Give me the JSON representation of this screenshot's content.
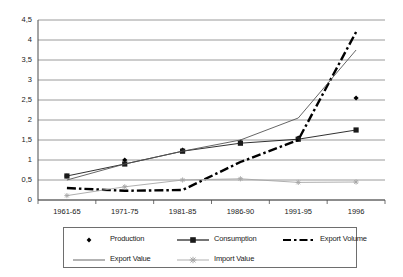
{
  "chart_data": {
    "type": "line",
    "title": "",
    "xlabel": "",
    "ylabel": "",
    "categories": [
      "1961-65",
      "1971-75",
      "1981-85",
      "1986-90",
      "1991-95",
      "1996"
    ],
    "ylim": [
      0,
      4.5
    ],
    "ytick_labels": [
      "4,5",
      "4",
      "3,5",
      "3",
      "2,5",
      "2",
      "1,5",
      "1",
      "0,5",
      "0"
    ],
    "ytick_values": [
      4.5,
      4,
      3.5,
      3,
      2.5,
      2,
      1.5,
      1,
      0.5,
      0
    ],
    "grid": "horizontal",
    "legend_position": "bottom",
    "series": [
      {
        "name": "Production",
        "marker": "diamond",
        "line": "none",
        "color": "#000000",
        "values": [
          0.6,
          1.0,
          1.25,
          1.45,
          1.55,
          2.55
        ]
      },
      {
        "name": "Consumption",
        "marker": "square",
        "line": "solid",
        "color": "#1a1a1a",
        "values": [
          0.6,
          0.9,
          1.22,
          1.42,
          1.52,
          1.75
        ]
      },
      {
        "name": "Export Volume",
        "marker": "none",
        "line": "dash-dot",
        "color": "#000000",
        "values": [
          0.3,
          0.23,
          0.25,
          0.95,
          1.5,
          4.2
        ]
      },
      {
        "name": "Export Value",
        "marker": "none",
        "line": "thin-solid",
        "color": "#555555",
        "values": [
          0.5,
          0.9,
          1.22,
          1.5,
          2.05,
          3.75
        ]
      },
      {
        "name": "Import Value",
        "marker": "star",
        "line": "thin-solid",
        "color": "#a6a6a6",
        "values": [
          0.11,
          0.33,
          0.5,
          0.53,
          0.44,
          0.45
        ]
      }
    ]
  },
  "legend": {
    "items": [
      {
        "label": "Production"
      },
      {
        "label": "Consumption"
      },
      {
        "label": "Export Volume"
      },
      {
        "label": "Export Value"
      },
      {
        "label": "Import Value"
      }
    ]
  },
  "colors": {
    "axis": "#4d4d4d",
    "grid": "#808080",
    "plot_background": "#ffffff",
    "page_background": "#ffffff"
  }
}
